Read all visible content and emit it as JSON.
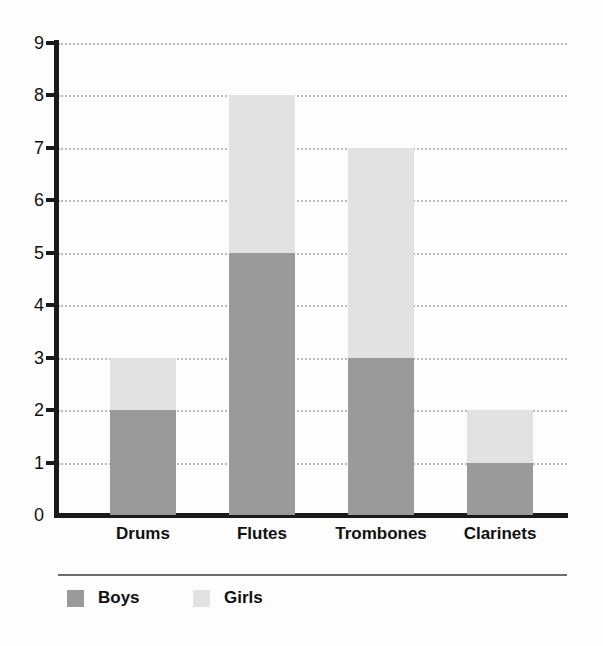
{
  "chart_data": {
    "type": "bar",
    "subtype": "stacked-vertical-bar",
    "title": "",
    "subtitle": "",
    "xlabel": "",
    "ylabel": "",
    "categories": [
      "Drums",
      "Flutes",
      "Trombones",
      "Clarinets"
    ],
    "series": [
      {
        "name": "Boys",
        "values": [
          2,
          5,
          3,
          1
        ],
        "color": "#9a9a9a"
      },
      {
        "name": "Girls",
        "values": [
          1,
          3,
          4,
          1
        ],
        "color": "#e2e2e2"
      }
    ],
    "totals": [
      3,
      8,
      7,
      2
    ],
    "ylim": [
      0,
      9
    ],
    "y_ticks": [
      0,
      1,
      2,
      3,
      4,
      5,
      6,
      7,
      8,
      9
    ],
    "y_tick_labels": [
      "0",
      "1",
      "2",
      "3",
      "4",
      "5",
      "6",
      "7",
      "8",
      "9"
    ],
    "grid": true,
    "grid_style": "dotted",
    "grid_axis": "y",
    "legend_position": "bottom-left",
    "legend_entries": [
      "Boys",
      "Girls"
    ],
    "annotations": []
  },
  "colors": {
    "boys": "#9a9a9a",
    "girls": "#e2e2e2",
    "axis": "#1a1a1a",
    "grid": "#b9b9b9",
    "text": "#111111",
    "legend_rule": "#6d6d6d",
    "background": "#fdfdfd"
  }
}
